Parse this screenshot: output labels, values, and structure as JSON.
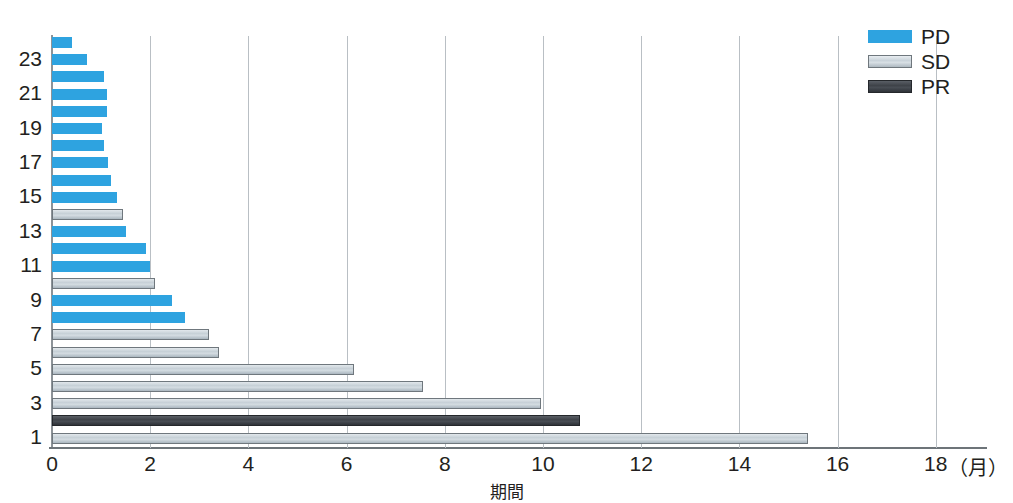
{
  "page": {
    "top_cropped_text": "・・・・・・・・・・・・・・・・・・・・・・・・・・・・・・"
  },
  "legend": {
    "position": "top-right",
    "items": [
      {
        "label": "PD",
        "swatch": "pd",
        "color": "#2ea3e0"
      },
      {
        "label": "SD",
        "swatch": "sd",
        "color": "#c9d3da"
      },
      {
        "label": "PR",
        "swatch": "pr",
        "color": "#40454b"
      }
    ]
  },
  "axes": {
    "x_label": "期間",
    "x_unit": "（月）",
    "x_ticks": [
      "0",
      "2",
      "4",
      "6",
      "8",
      "10",
      "12",
      "14",
      "16",
      "18"
    ],
    "y_ticks": [
      "1",
      "3",
      "5",
      "7",
      "9",
      "11",
      "13",
      "15",
      "17",
      "19",
      "21",
      "23"
    ]
  },
  "chart_data": {
    "type": "bar",
    "orientation": "horizontal",
    "title": "",
    "xlabel": "期間",
    "ylabel": "",
    "xlim": [
      0,
      19
    ],
    "xticks": [
      0,
      2,
      4,
      6,
      8,
      10,
      12,
      14,
      16,
      18
    ],
    "xunit": "月",
    "grid": "vertical",
    "legend_position": "top-right",
    "categories": [
      "1",
      "2",
      "3",
      "4",
      "5",
      "6",
      "7",
      "8",
      "9",
      "10",
      "11",
      "12",
      "13",
      "14",
      "15",
      "16",
      "17",
      "18",
      "19",
      "20",
      "21",
      "22",
      "23",
      "24"
    ],
    "series": [
      {
        "name": "PD",
        "color": "#2ea3e0"
      },
      {
        "name": "SD",
        "color": "#c9d3da"
      },
      {
        "name": "PR",
        "color": "#40454b"
      }
    ],
    "bars": [
      {
        "subject": 24,
        "value": 0.4,
        "response": "PD"
      },
      {
        "subject": 23,
        "value": 0.72,
        "response": "PD"
      },
      {
        "subject": 22,
        "value": 1.05,
        "response": "PD"
      },
      {
        "subject": 21,
        "value": 1.12,
        "response": "PD"
      },
      {
        "subject": 20,
        "value": 1.12,
        "response": "PD"
      },
      {
        "subject": 19,
        "value": 1.02,
        "response": "PD"
      },
      {
        "subject": 18,
        "value": 1.05,
        "response": "PD"
      },
      {
        "subject": 17,
        "value": 1.15,
        "response": "PD"
      },
      {
        "subject": 16,
        "value": 1.2,
        "response": "PD"
      },
      {
        "subject": 15,
        "value": 1.32,
        "response": "PD"
      },
      {
        "subject": 14,
        "value": 1.45,
        "response": "SD"
      },
      {
        "subject": 13,
        "value": 1.5,
        "response": "PD"
      },
      {
        "subject": 12,
        "value": 1.92,
        "response": "PD"
      },
      {
        "subject": 11,
        "value": 2.0,
        "response": "PD"
      },
      {
        "subject": 10,
        "value": 2.1,
        "response": "SD"
      },
      {
        "subject": 9,
        "value": 2.45,
        "response": "PD"
      },
      {
        "subject": 8,
        "value": 2.7,
        "response": "PD"
      },
      {
        "subject": 7,
        "value": 3.2,
        "response": "SD"
      },
      {
        "subject": 6,
        "value": 3.4,
        "response": "SD"
      },
      {
        "subject": 5,
        "value": 6.15,
        "response": "SD"
      },
      {
        "subject": 4,
        "value": 7.55,
        "response": "SD"
      },
      {
        "subject": 3,
        "value": 9.95,
        "response": "SD"
      },
      {
        "subject": 2,
        "value": 10.75,
        "response": "PR"
      },
      {
        "subject": 1,
        "value": 15.4,
        "response": "SD"
      }
    ]
  }
}
